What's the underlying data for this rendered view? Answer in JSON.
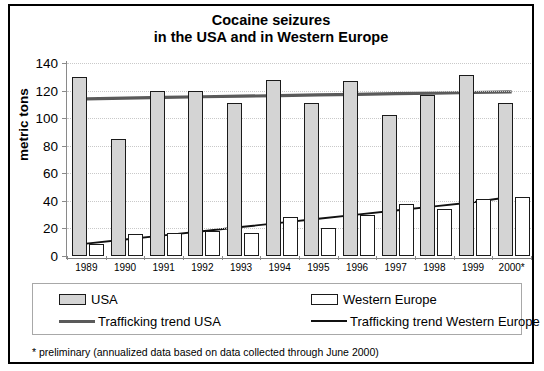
{
  "chart_data": {
    "type": "bar",
    "title": "Cocaine seizures in the USA and in Western Europe",
    "title_line1": "Cocaine seizures",
    "title_line2": "in the USA and in Western Europe",
    "xlabel": "",
    "ylabel": "metric tons",
    "ylim": [
      0,
      140
    ],
    "ytick_step": 20,
    "yticks": [
      0,
      20,
      40,
      60,
      80,
      100,
      120,
      140
    ],
    "grid": true,
    "legend_position": "bottom",
    "categories": [
      "1989",
      "1990",
      "1991",
      "1992",
      "1993",
      "1994",
      "1995",
      "1996",
      "1997",
      "1998",
      "1999",
      "2000*"
    ],
    "series": [
      {
        "name": "USA",
        "kind": "bar",
        "color": "#d4d4d4",
        "values": [
          130,
          85,
          120,
          120,
          111,
          128,
          111,
          127,
          102,
          117,
          131,
          111
        ]
      },
      {
        "name": "Western Europe",
        "kind": "bar",
        "color": "#ffffff",
        "values": [
          9,
          16,
          17,
          18,
          17,
          28,
          20,
          30,
          38,
          34,
          41,
          43
        ]
      },
      {
        "name": "Trafficking trend USA",
        "kind": "line",
        "color": "#5a5a5a",
        "values": [
          114,
          114.5,
          115,
          115.5,
          115.9,
          116.4,
          116.9,
          117.3,
          117.8,
          118.2,
          118.6,
          119
        ]
      },
      {
        "name": "Trafficking trend Western Europe",
        "kind": "line",
        "color": "#111111",
        "values": [
          9,
          12,
          15,
          18,
          21,
          24,
          27,
          30,
          33,
          36,
          39,
          43
        ]
      }
    ],
    "annotations": [
      "* preliminary (annualized data based on data collected through June 2000)"
    ]
  },
  "legend": {
    "items": [
      {
        "label": "USA",
        "swatch": "box-gray"
      },
      {
        "label": "Western Europe",
        "swatch": "box-white"
      },
      {
        "label": "Trafficking trend USA",
        "swatch": "line-thick-gray"
      },
      {
        "label": "Trafficking trend Western Europe",
        "swatch": "line-thin-black"
      }
    ]
  },
  "footnote": {
    "text": "* preliminary (annualized data based on data collected through June 2000)"
  },
  "colors": {
    "usa_bar": "#d4d4d4",
    "we_bar": "#ffffff",
    "trend_usa": "#5a5a5a",
    "trend_we": "#111111",
    "axis": "#8a8a8a",
    "grid": "#c9c9c9",
    "border": "#000000"
  }
}
